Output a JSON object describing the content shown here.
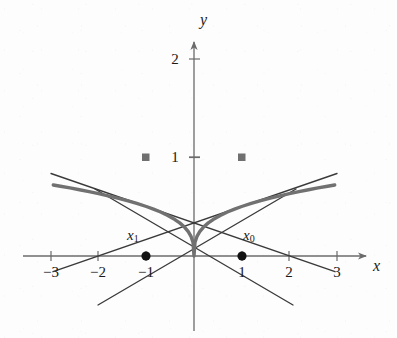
{
  "figure": {
    "background_color": "#fdfdfd",
    "width": 397,
    "height": 338
  },
  "axes": {
    "x_label": "x",
    "y_label": "y",
    "axis_color": "#6b6b6b",
    "origin_px": {
      "x": 194,
      "y": 256
    },
    "x_unit_px": 47.7,
    "y_unit_px": 49.5,
    "x_ticks": [
      {
        "value": -3,
        "label": "−3"
      },
      {
        "value": -2,
        "label": "−2"
      },
      {
        "value": -1,
        "label": "−1"
      },
      {
        "value": 1,
        "label": "1"
      },
      {
        "value": 2,
        "label": "2"
      },
      {
        "value": 3,
        "label": "3"
      }
    ],
    "y_ticks": [
      {
        "value": 1,
        "label": "1"
      },
      {
        "value": 2,
        "label": "2"
      }
    ]
  },
  "annotations": [
    {
      "name": "x-sub-1",
      "base": "x",
      "subscript": "1",
      "at_x": -1,
      "at_y": 0,
      "label_px": {
        "x": 127,
        "y": 229
      }
    },
    {
      "name": "x-sub-0",
      "base": "x",
      "subscript": "0",
      "at_x": 1,
      "at_y": 0,
      "label_px": {
        "x": 243,
        "y": 229
      }
    }
  ],
  "chart_data": {
    "type": "line",
    "title": "",
    "xlabel": "x",
    "ylabel": "y",
    "xlim": [
      -3.55,
      3.8
    ],
    "ylim": [
      -1.0,
      2.2
    ],
    "grid": false,
    "legend": null,
    "series": [
      {
        "name": "curve",
        "expression": "y = |x|^(1/3)",
        "role": "function-curve",
        "color": "#717171",
        "width": 3.4,
        "x": [
          -2.95,
          -2.8,
          -2.6,
          -2.4,
          -2.2,
          -2.0,
          -1.8,
          -1.6,
          -1.4,
          -1.2,
          -1.0,
          -0.85,
          -0.7,
          -0.55,
          -0.4,
          -0.3,
          -0.2,
          -0.12,
          -0.06,
          -0.02,
          0,
          0.02,
          0.06,
          0.12,
          0.2,
          0.3,
          0.4,
          0.55,
          0.7,
          0.85,
          1.0,
          1.2,
          1.4,
          1.6,
          1.8,
          2.0,
          2.2,
          2.4,
          2.6,
          2.8,
          2.95
        ],
        "y": [
          1.435,
          1.409,
          1.375,
          1.339,
          1.301,
          1.26,
          1.216,
          1.17,
          1.119,
          1.063,
          1.0,
          0.947,
          0.888,
          0.819,
          0.737,
          0.669,
          0.585,
          0.493,
          0.391,
          0.271,
          0,
          0.271,
          0.391,
          0.493,
          0.585,
          0.669,
          0.737,
          0.819,
          0.888,
          0.947,
          1.0,
          1.063,
          1.119,
          1.17,
          1.216,
          1.26,
          1.301,
          1.339,
          1.375,
          1.409,
          1.435
        ]
      },
      {
        "name": "tangent-right",
        "expression": "y = (1/3)x + 2/3",
        "role": "tangent-line",
        "tangent_at": {
          "x": 1,
          "y": 1
        },
        "x_intercept": -2,
        "color": "#3a3a3a",
        "width": 1.3,
        "x": [
          -2.95,
          3.0
        ],
        "y": [
          -0.317,
          1.667
        ]
      },
      {
        "name": "tangent-left",
        "expression": "y = -(1/3)x + 2/3",
        "role": "tangent-line",
        "tangent_at": {
          "x": -1,
          "y": 1
        },
        "x_intercept": 2,
        "color": "#3a3a3a",
        "width": 1.3,
        "x": [
          -3.0,
          2.95
        ],
        "y": [
          1.667,
          -0.317
        ]
      },
      {
        "name": "secant-right",
        "expression": "line through (1,1) and (1,0) region",
        "role": "newton-step-line",
        "color": "#3a3a3a",
        "width": 1.3,
        "x": [
          -2.08,
          2.08
        ],
        "y": [
          1.35,
          -0.99
        ]
      }
    ],
    "markers": [
      {
        "name": "curve-point-left",
        "x": -1,
        "y": 1,
        "shape": "square",
        "color": "#707070",
        "size": 7
      },
      {
        "name": "curve-point-right",
        "x": 1,
        "y": 1,
        "shape": "square",
        "color": "#707070",
        "size": 7
      },
      {
        "name": "root-x1",
        "x": -1,
        "y": 0,
        "shape": "circle",
        "color": "#121212",
        "size": 8
      },
      {
        "name": "root-x0",
        "x": 1,
        "y": 0,
        "shape": "circle",
        "color": "#121212",
        "size": 8
      }
    ]
  }
}
